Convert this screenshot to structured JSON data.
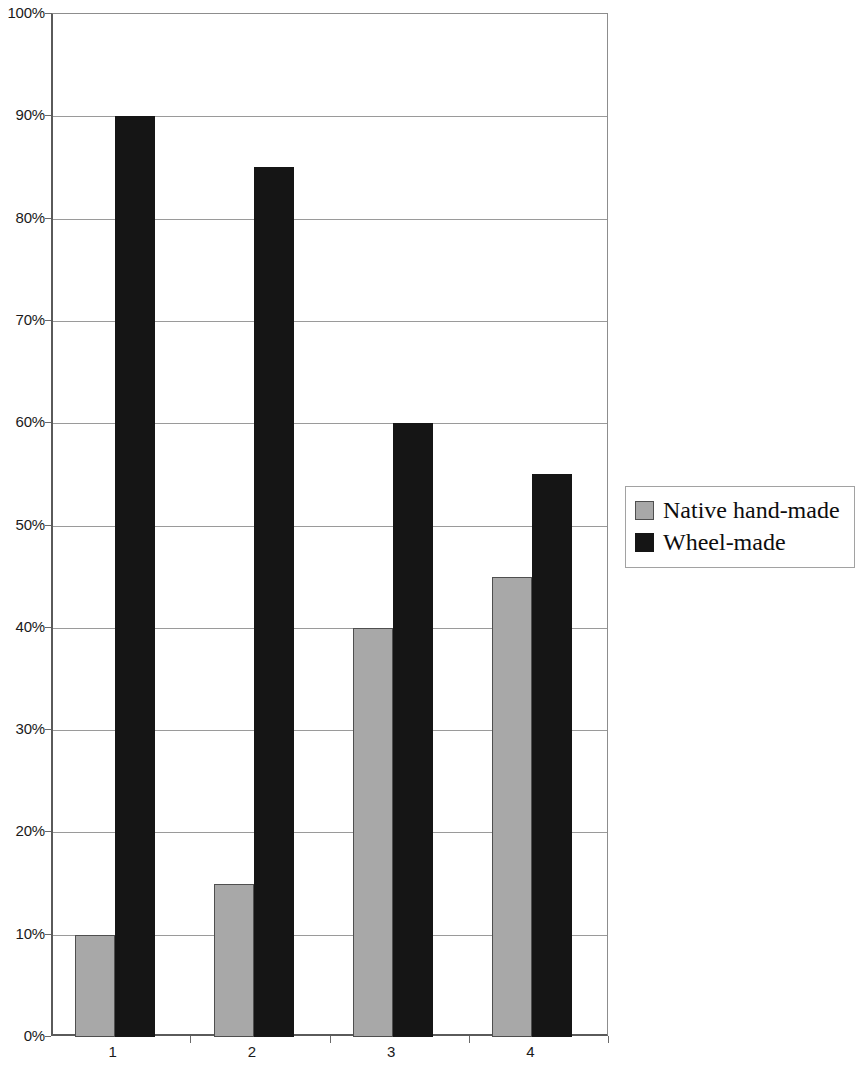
{
  "chart_data": {
    "type": "bar",
    "title": "",
    "subtitle": "",
    "xlabel": "",
    "ylabel": "",
    "categories": [
      "1",
      "2",
      "3",
      "4"
    ],
    "series": [
      {
        "name": "Native hand-made",
        "color": "#a8a8a8",
        "values": [
          10,
          15,
          40,
          45
        ]
      },
      {
        "name": "Wheel-made",
        "color": "#151515",
        "values": [
          90,
          85,
          60,
          55
        ]
      }
    ],
    "ylim": [
      0,
      100
    ],
    "y_tick_values": [
      0,
      10,
      20,
      30,
      40,
      50,
      60,
      70,
      80,
      90,
      100
    ],
    "y_tick_labels": [
      "0%",
      "10%",
      "20%",
      "30%",
      "40%",
      "50%",
      "60%",
      "70%",
      "80%",
      "90%",
      "100%"
    ],
    "grid": true,
    "grid_axis": "y",
    "legend_position": "right",
    "value_unit": "%"
  },
  "legend": {
    "entries": [
      {
        "label": "Native hand-made"
      },
      {
        "label": "Wheel-made"
      }
    ]
  }
}
